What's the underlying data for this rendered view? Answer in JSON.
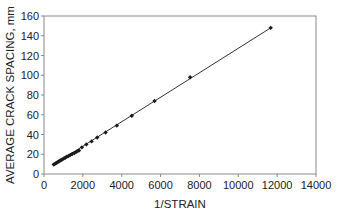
{
  "chart_data": {
    "type": "scatter",
    "title": "",
    "xlabel": "1/STRAIN",
    "ylabel": "AVERAGE CRACK SPACING, mm",
    "xlim": [
      0,
      14000
    ],
    "ylim": [
      0,
      160
    ],
    "xticks": [
      0,
      2000,
      4000,
      6000,
      8000,
      10000,
      12000,
      14000
    ],
    "yticks": [
      0,
      20,
      40,
      60,
      80,
      100,
      120,
      140,
      160
    ],
    "grid": false,
    "legend": null,
    "series": [
      {
        "name": "Measured",
        "marker": "diamond",
        "line": "linear fit",
        "color": "#1a1a1a",
        "x": [
          500,
          560,
          620,
          680,
          740,
          800,
          870,
          940,
          1010,
          1090,
          1170,
          1260,
          1350,
          1450,
          1560,
          1680,
          1800,
          1950,
          2180,
          2450,
          2740,
          3170,
          3750,
          4520,
          5690,
          7520,
          11670
        ],
        "y": [
          9.5,
          10.3,
          11,
          11.8,
          12.5,
          13.2,
          14,
          14.8,
          15.6,
          16.5,
          17.4,
          18.3,
          19.2,
          20.2,
          21.3,
          22.5,
          23.8,
          27,
          30,
          33,
          37,
          42,
          49,
          59,
          74,
          98,
          148
        ]
      }
    ]
  }
}
